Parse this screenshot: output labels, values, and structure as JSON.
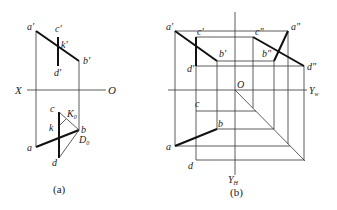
{
  "figure_a": {
    "caption": "(a)",
    "axis": {
      "left_label": "X",
      "right_label": "O"
    },
    "labels": {
      "a_prime": "a'",
      "b_prime": "b'",
      "c_prime": "c'",
      "d_prime": "d'",
      "k_prime": "k'",
      "a": "a",
      "b": "b",
      "c": "c",
      "d": "d",
      "k": "k",
      "K0": "K",
      "K0_sub": "0",
      "D0": "D",
      "D0_sub": "0"
    }
  },
  "figure_b": {
    "caption": "(b)",
    "axis": {
      "origin_label": "O",
      "yw_label": "Y",
      "yw_sub": "w",
      "yh_label": "Y",
      "yh_sub": "H"
    },
    "labels": {
      "a_prime": "a'",
      "b_prime": "b'",
      "c_prime": "c'",
      "d_prime": "d'",
      "a_dprime": "a\"",
      "b_dprime": "b\"",
      "c_dprime": "c\"",
      "d_dprime": "d\"",
      "a": "a",
      "b": "b",
      "c": "c",
      "d": "d"
    }
  }
}
